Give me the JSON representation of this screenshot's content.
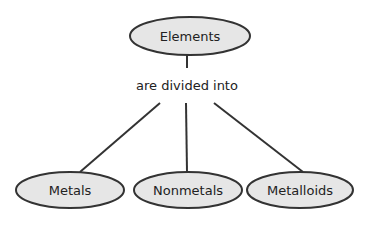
{
  "diagram": {
    "root": {
      "label": "Elements"
    },
    "link_label": "are divided into",
    "children": [
      {
        "label": "Metals"
      },
      {
        "label": "Nonmetals"
      },
      {
        "label": "Metalloids"
      }
    ],
    "colors": {
      "node_fill": "#e6e6e6",
      "stroke": "#333333"
    }
  }
}
